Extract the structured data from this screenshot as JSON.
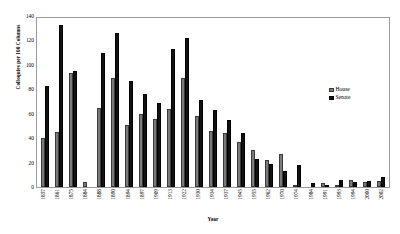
{
  "chart_data": {
    "type": "bar",
    "title": "",
    "xlabel": "Year",
    "ylabel": "Colloquies per 100 Columns",
    "ylim": [
      0,
      140
    ],
    "yticks": [
      0,
      20,
      40,
      60,
      80,
      100,
      120,
      140
    ],
    "grid": false,
    "legend_position": "inside-right",
    "categories": [
      "1857",
      "1861",
      "1875",
      "1884",
      "1888",
      "1890",
      "1894",
      "1897",
      "1909",
      "1913",
      "1922",
      "1930",
      "1934",
      "1937",
      "1945",
      "1955",
      "1962",
      "1970",
      "1974",
      "1984",
      "1991",
      "1993",
      "1994",
      "2000",
      "2002"
    ],
    "series": [
      {
        "name": "House",
        "color": "#7b7b7b",
        "values": [
          40,
          45,
          93,
          4,
          65,
          89,
          51,
          60,
          56,
          64,
          89,
          58,
          46,
          44,
          37,
          30,
          22,
          27,
          1,
          0,
          3,
          2,
          6,
          4,
          5
        ]
      },
      {
        "name": "Senate",
        "color": "#111111",
        "values": [
          83,
          133,
          95,
          0,
          110,
          126,
          87,
          76,
          69,
          113,
          122,
          71,
          63,
          55,
          44,
          23,
          19,
          13,
          18,
          3,
          2,
          6,
          4,
          5,
          8
        ]
      }
    ]
  },
  "legend": {
    "items": [
      {
        "label": "House",
        "swatch": "house"
      },
      {
        "label": "Senate",
        "swatch": "senate"
      }
    ]
  },
  "axes": {
    "y_title": "Colloquies per 100 Columns",
    "x_title": "Year"
  }
}
